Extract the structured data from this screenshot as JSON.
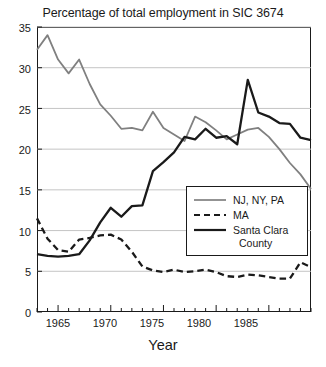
{
  "chart_data": {
    "type": "line",
    "title": "Percentage of total employment in SIC 3674",
    "xlabel": "Year",
    "ylabel": "",
    "xlim": [
      1963,
      1989
    ],
    "ylim": [
      0,
      35
    ],
    "ytick_values": [
      0,
      5,
      10,
      15,
      20,
      25,
      30,
      35
    ],
    "ytick_labels": [
      "0",
      "5",
      "10",
      "15",
      "20",
      "25",
      "30",
      "35"
    ],
    "xtick_values": [
      1965,
      1970,
      1975,
      1980,
      1985
    ],
    "xtick_labels": [
      "1965",
      "1970",
      "1975",
      "1980",
      "1985"
    ],
    "xtick_minor_step": 1,
    "grid": "horizontal",
    "legend_position": "center-right",
    "x": [
      1963,
      1964,
      1965,
      1966,
      1967,
      1968,
      1969,
      1970,
      1971,
      1972,
      1973,
      1974,
      1975,
      1976,
      1977,
      1978,
      1979,
      1980,
      1981,
      1982,
      1983,
      1984,
      1985,
      1986,
      1987,
      1988,
      1989
    ],
    "series": [
      {
        "name": "NJ, NY, PA",
        "color": "#808080",
        "style": "solid",
        "values": [
          32.2,
          34.0,
          31.0,
          29.3,
          31.0,
          28.0,
          25.5,
          24.1,
          22.5,
          22.6,
          22.3,
          24.6,
          22.6,
          21.8,
          21.0,
          24.0,
          23.3,
          22.3,
          21.2,
          21.8,
          22.4,
          22.6,
          21.5,
          20.0,
          18.3,
          16.9,
          15.1
        ]
      },
      {
        "name": "MA",
        "color": "#1a1a1a",
        "style": "dashed",
        "values": [
          11.5,
          9.0,
          7.6,
          7.4,
          8.9,
          9.1,
          9.4,
          9.5,
          8.9,
          7.4,
          5.6,
          5.1,
          4.9,
          5.2,
          4.9,
          5.0,
          5.2,
          4.9,
          4.4,
          4.3,
          4.6,
          4.5,
          4.3,
          4.1,
          4.1,
          6.1,
          5.5
        ]
      },
      {
        "name": "Santa Clara County",
        "color": "#1a1a1a",
        "style": "solid",
        "values": [
          7.1,
          6.9,
          6.8,
          6.9,
          7.1,
          8.8,
          11.0,
          12.8,
          11.7,
          13.0,
          13.1,
          17.3,
          18.4,
          19.6,
          21.5,
          21.2,
          22.5,
          21.4,
          21.6,
          20.6,
          28.5,
          24.5,
          24.0,
          23.2,
          23.1,
          21.4,
          21.1
        ]
      }
    ]
  },
  "legend": {
    "items": [
      {
        "label": "NJ, NY, PA"
      },
      {
        "label": "MA"
      },
      {
        "label": "Santa Clara"
      }
    ],
    "continuation": "County"
  }
}
